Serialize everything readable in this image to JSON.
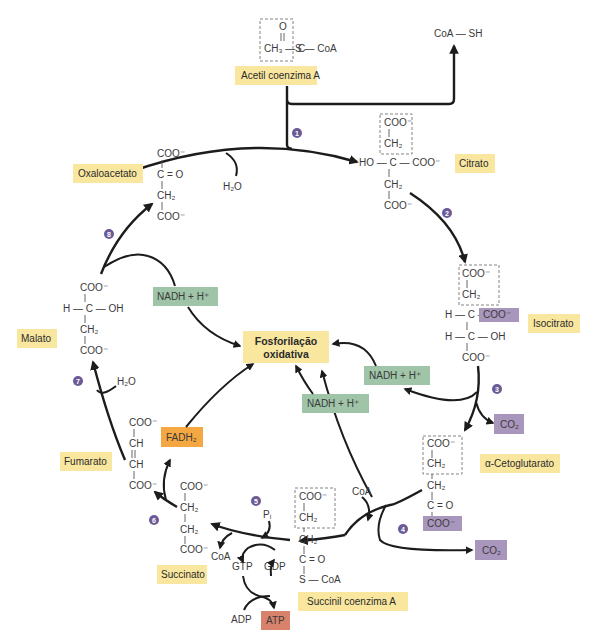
{
  "colors": {
    "name_label_bg": "#f9e79f",
    "nadh_bg": "#9fc4a8",
    "co2_bg": "#a996bd",
    "fadh2_bg": "#f5a742",
    "atp_bg": "#d9826b",
    "step_badge": "#6b5a96",
    "arrow": "#1c1c1c"
  },
  "center": {
    "line1": "Fosforilação",
    "line2": "oxidativa"
  },
  "compounds": {
    "acetil_coa": {
      "name": "Acetil coenzima A",
      "o": "O",
      "ch3": "CH₃ — C",
      "s_coa": "S — CoA"
    },
    "coa_sh": {
      "text": "CoA — SH"
    },
    "citrato": {
      "name": "Citrato",
      "coo1": "COO⁻",
      "ch2a": "CH₂",
      "ho": "HO — C — COO⁻",
      "ch2b": "CH₂",
      "coo2": "COO⁻"
    },
    "isocitrato": {
      "name": "Isocitrato",
      "coo1": "COO⁻",
      "ch2": "CH₂",
      "h1": "H — C —",
      "coo_box": "COO⁻",
      "h2": "H — C — OH",
      "coo2": "COO⁻"
    },
    "cetoglutarato": {
      "name": "α-Cetoglutarato",
      "coo1": "COO⁻",
      "ch2a": "CH₂",
      "ch2b": "CH₂",
      "co": "C = O",
      "coo_box": "COO⁻"
    },
    "succinil_coa": {
      "name": "Succinil coenzima A",
      "coo": "COO⁻",
      "ch2a": "CH₂",
      "ch2b": "CH₂",
      "co": "C = O",
      "s_coa": "S — CoA"
    },
    "succinato": {
      "name": "Succinato",
      "coo1": "COO⁻",
      "ch2a": "CH₂",
      "ch2b": "CH₂",
      "coo2": "COO⁻"
    },
    "fumarato": {
      "name": "Fumarato",
      "coo1": "COO⁻",
      "ch1": "CH",
      "ch2": "CH",
      "coo2": "COO⁻"
    },
    "malato": {
      "name": "Malato",
      "coo1": "COO⁻",
      "hcoh": "H — C — OH",
      "ch2": "CH₂",
      "coo2": "COO⁻"
    },
    "oxaloacetato": {
      "name": "Oxaloacetato",
      "coo1": "COO⁻",
      "co": "C = O",
      "ch2": "CH₂",
      "coo2": "COO⁻"
    }
  },
  "cofactors": {
    "h2o_1": "H₂O",
    "h2o_7": "H₂O",
    "nadh_8": "NADH +  H⁺",
    "nadh_3": "NADH +  H⁺",
    "nadh_4": "NADH +  H⁺",
    "co2_3": "CO₂",
    "co2_4": "CO₂",
    "coa_4": "CoA",
    "coa_5": "CoA",
    "pi": "Pᵢ",
    "gtp": "GTP",
    "gdp": "GDP",
    "adp": "ADP",
    "atp": "ATP",
    "fadh2": "FADH₂"
  },
  "steps": [
    "1",
    "2",
    "3",
    "4",
    "5",
    "6",
    "7",
    "8"
  ]
}
